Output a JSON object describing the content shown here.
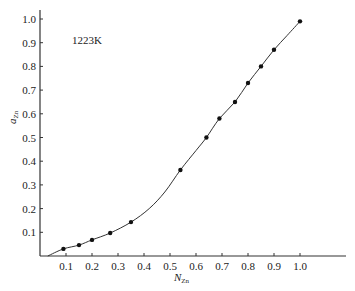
{
  "chart_data": {
    "type": "line",
    "title": "",
    "annotation": "1223K",
    "xlabel": "N_Zn",
    "xlabel_main": "N",
    "xlabel_sub": "Zn",
    "ylabel": "a_Zn",
    "ylabel_main": "a",
    "ylabel_sub": "Zn",
    "xlim": [
      0,
      1.17
    ],
    "ylim": [
      0,
      1.03
    ],
    "xticks": [
      0.1,
      0.2,
      0.3,
      0.4,
      0.5,
      0.6,
      0.7,
      0.8,
      0.9,
      1.0
    ],
    "xtick_labels": [
      "0.1",
      "0.2",
      "0.3",
      "0.4",
      "0.5",
      "0.6",
      "0.7",
      "0.8",
      "0.9",
      "1.0"
    ],
    "yticks": [
      0.1,
      0.2,
      0.3,
      0.4,
      0.5,
      0.6,
      0.7,
      0.8,
      0.9,
      1.0
    ],
    "ytick_labels": [
      "0.1",
      "0.2",
      "0.3",
      "0.4",
      "0.5",
      "0.6",
      "0.7",
      "0.8",
      "0.9",
      "1.0"
    ],
    "grid": false,
    "legend": null,
    "series": [
      {
        "name": "measured a_Zn (1223K)",
        "marker": "circle",
        "x": [
          0.09,
          0.15,
          0.2,
          0.27,
          0.35,
          0.54,
          0.64,
          0.69,
          0.75,
          0.8,
          0.85,
          0.9,
          1.0
        ],
        "y": [
          0.03,
          0.046,
          0.068,
          0.097,
          0.143,
          0.363,
          0.5,
          0.58,
          0.65,
          0.73,
          0.8,
          0.87,
          0.99
        ]
      }
    ],
    "curve": {
      "name": "fitted curve",
      "x": [
        0.03,
        0.09,
        0.15,
        0.2,
        0.27,
        0.35,
        0.42,
        0.48,
        0.54,
        0.6,
        0.64,
        0.69,
        0.75,
        0.8,
        0.85,
        0.9,
        0.95,
        1.0
      ],
      "y": [
        0.0,
        0.03,
        0.046,
        0.068,
        0.097,
        0.143,
        0.2,
        0.27,
        0.363,
        0.445,
        0.5,
        0.58,
        0.65,
        0.73,
        0.8,
        0.87,
        0.93,
        0.99
      ]
    },
    "colors": {
      "line": "#333333",
      "marker": "#111111",
      "axis": "#333333"
    }
  }
}
